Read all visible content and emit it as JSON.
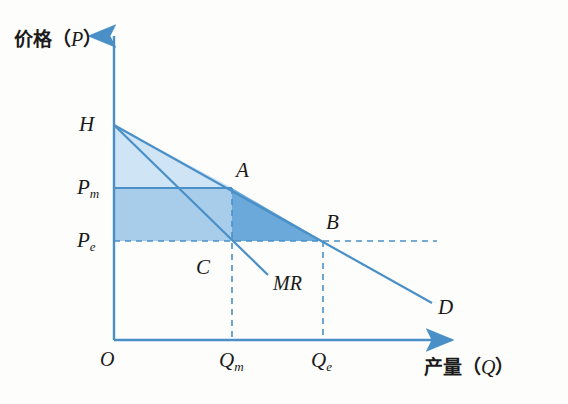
{
  "figure": {
    "type": "economics-diagram",
    "background_color": "#fdfdfb",
    "line_color": "#4a90c7",
    "axis_color": "#4a90c7",
    "label_color": "#1a1a1a"
  },
  "axes": {
    "y_axis": {
      "name": "price-axis",
      "label_cjk": "价格",
      "label_paren_open": "（",
      "label_symbol": "P",
      "label_paren_close": "）"
    },
    "x_axis": {
      "name": "quantity-axis",
      "label_cjk": "产量",
      "label_paren_open": "（",
      "label_symbol": "Q",
      "label_paren_close": "）"
    },
    "origin_label": "O"
  },
  "y_ticks": [
    {
      "id": "H",
      "label": "H",
      "sub": "",
      "value_px": 125
    },
    {
      "id": "Pm",
      "label": "P",
      "sub": "m",
      "value_px": 188
    },
    {
      "id": "Pe",
      "label": "P",
      "sub": "e",
      "value_px": 241
    }
  ],
  "x_ticks": [
    {
      "id": "Qm",
      "label": "Q",
      "sub": "m",
      "value_px": 232
    },
    {
      "id": "Qe",
      "label": "Q",
      "sub": "e",
      "value_px": 323
    }
  ],
  "curves": [
    {
      "id": "D",
      "label": "D",
      "name": "demand-curve",
      "from": [
        114,
        125
      ],
      "to": [
        432,
        303
      ]
    },
    {
      "id": "MR",
      "label": "MR",
      "name": "marginal-revenue-curve",
      "from": [
        114,
        125
      ],
      "to": [
        268,
        275
      ]
    }
  ],
  "points": [
    {
      "id": "A",
      "label": "A",
      "x": 232,
      "y": 188,
      "name": "point-a-monopoly-equilibrium"
    },
    {
      "id": "B",
      "label": "B",
      "x": 323,
      "y": 241,
      "name": "point-b-competitive-equilibrium"
    },
    {
      "id": "C",
      "label": "C",
      "x": 232,
      "y": 241,
      "name": "point-c-marginal-cost-intersection"
    }
  ],
  "shaded_regions": [
    {
      "id": "consumer-surplus",
      "color": "#cfe4f5",
      "opacity": 1,
      "note": "triangle H-A-Pm light blue"
    },
    {
      "id": "monopoly-profit",
      "color": "#a8cdeb",
      "opacity": 1,
      "note": "rectangle Pm-A-C-Pe medium blue"
    },
    {
      "id": "deadweight-loss",
      "color": "#6aa9da",
      "opacity": 1,
      "note": "triangle A-B-C dark blue"
    }
  ],
  "dashed_lines": [
    {
      "id": "qm-vertical",
      "name": "qm-dashed-line"
    },
    {
      "id": "qe-vertical",
      "name": "qe-dashed-line"
    },
    {
      "id": "pe-horizontal",
      "name": "pe-dashed-line"
    }
  ]
}
